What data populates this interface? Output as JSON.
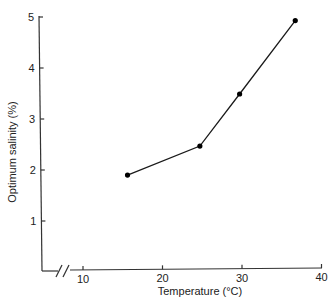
{
  "chart_data": {
    "type": "line",
    "title": "",
    "xlabel": "Temperature (°C)",
    "ylabel": "Optimum salinity (%)",
    "x_ticks": [
      10,
      20,
      30,
      40
    ],
    "y_ticks": [
      1,
      2,
      3,
      4,
      5
    ],
    "xlim": [
      5,
      40
    ],
    "ylim": [
      0,
      5
    ],
    "x_axis_break": true,
    "grid": false,
    "legend": null,
    "series": [
      {
        "name": "Optimum salinity",
        "x": [
          15.6,
          24.7,
          29.7,
          36.7
        ],
        "y": [
          1.9,
          2.47,
          3.49,
          4.93
        ],
        "marker": "filled-circle"
      }
    ]
  },
  "axes": {
    "x_label": "Temperature (°C)",
    "y_label": "Optimum salinity (%)",
    "x_tick_labels": [
      "10",
      "20",
      "30",
      "40"
    ],
    "y_tick_labels": [
      "1",
      "2",
      "3",
      "4",
      "5"
    ]
  }
}
